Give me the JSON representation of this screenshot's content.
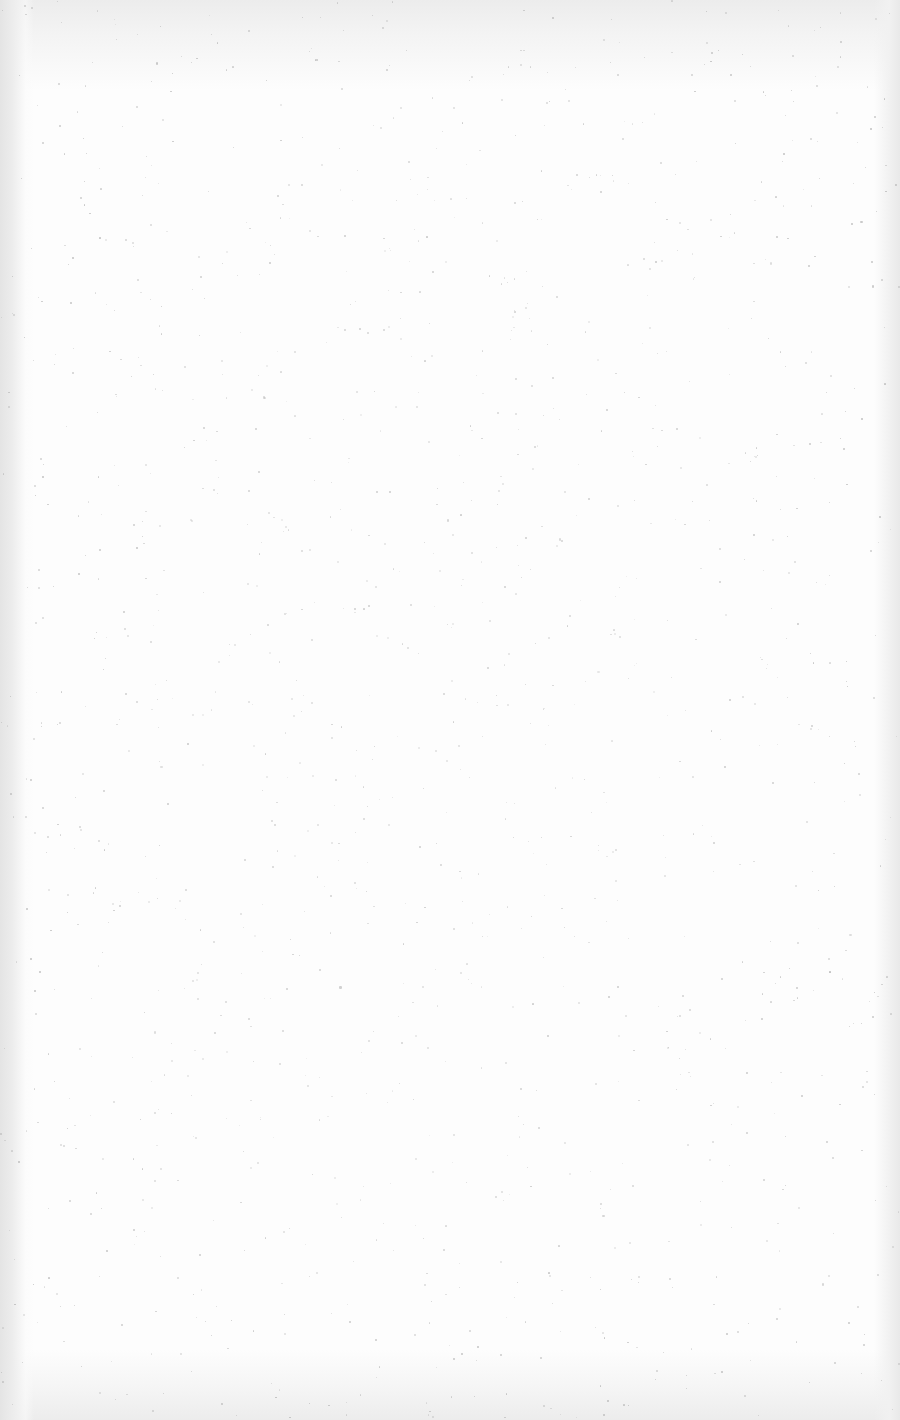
{
  "document": {
    "type": "blank scanned page",
    "text_content": "",
    "colors": {
      "paper": "#fdfdfd",
      "edge_shadow": "#e4e4e4",
      "speckle": "#b8b8b8"
    }
  }
}
